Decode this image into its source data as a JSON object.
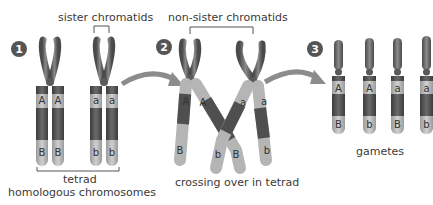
{
  "steps": [
    {
      "number": "1",
      "top_label": "sister chromatids",
      "bottom_label_1": "tetrad",
      "bottom_label_2": "homologous chromosomes"
    },
    {
      "number": "2",
      "top_label": "non-sister chromatids",
      "bottom_label_1": "crossing over in tetrad"
    },
    {
      "number": "3",
      "bottom_label_1": "gametes"
    }
  ],
  "step1": {
    "chromosome_left": {
      "upper_genes": [
        "A",
        "A"
      ],
      "lower_genes": [
        "B",
        "B"
      ]
    },
    "chromosome_right": {
      "upper_genes": [
        "a",
        "a"
      ],
      "lower_genes": [
        "b",
        "b"
      ]
    }
  },
  "step2": {
    "left_chromatid_outer": {
      "upper": "A",
      "lower": "B"
    },
    "left_chromatid_inner": {
      "upper": "A",
      "lower": "b"
    },
    "right_chromatid_inner": {
      "upper": "a",
      "lower": "B"
    },
    "right_chromatid_outer": {
      "upper": "a",
      "lower": "b"
    }
  },
  "step3": {
    "gametes": [
      {
        "upper": "A",
        "lower": "B"
      },
      {
        "upper": "A",
        "lower": "b"
      },
      {
        "upper": "a",
        "lower": "B"
      },
      {
        "upper": "a",
        "lower": "b"
      }
    ]
  },
  "colors": {
    "dark": "#5a5a5a",
    "mid": "#8a8a8a",
    "light": "#b5b5b5",
    "arrow": "#8c8c8c",
    "badge": "#555555"
  }
}
